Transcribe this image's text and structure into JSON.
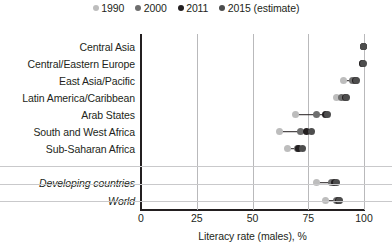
{
  "legend": {
    "items": [
      {
        "label": "1990",
        "color": "#bdbdbd",
        "name": "legend-1990"
      },
      {
        "label": "2000",
        "color": "#6e6e6e",
        "name": "legend-2000"
      },
      {
        "label": "2011",
        "color": "#231f20",
        "name": "legend-2011"
      },
      {
        "label": "2015 (estimate)",
        "color": "#4d4d4d",
        "name": "legend-2015"
      }
    ]
  },
  "chart_data": {
    "type": "scatter",
    "title": "",
    "xlabel": "Literacy rate (males), %",
    "ylabel": "",
    "xlim": [
      0,
      100
    ],
    "xticks": [
      0,
      25,
      50,
      75,
      100
    ],
    "grid": true,
    "legend_position": "top-center",
    "series": [
      {
        "name": "1990",
        "color": "#bdbdbd"
      },
      {
        "name": "2000",
        "color": "#6e6e6e"
      },
      {
        "name": "2011",
        "color": "#231f20"
      },
      {
        "name": "2015 (estimate)",
        "color": "#4d4d4d"
      }
    ],
    "categories": [
      "Central Asia",
      "Central/Eastern Europe",
      "East Asia/Pacific",
      "Latin America/Caribbean",
      "Arab States",
      "South and West Africa",
      "Sub-Saharan Africa",
      "Developing countries",
      "World"
    ],
    "rows": [
      {
        "label": "Central Asia",
        "italic": false,
        "group": "region",
        "values": {
          "1990": 99.6,
          "2000": 99.7,
          "2011": 99.8,
          "2015": 99.8
        }
      },
      {
        "label": "Central/Eastern Europe",
        "italic": false,
        "group": "region",
        "values": {
          "1990": 99.2,
          "2000": 99.4,
          "2011": 99.5,
          "2015": 99.6
        }
      },
      {
        "label": "East Asia/Pacific",
        "italic": false,
        "group": "region",
        "values": {
          "1990": 90.8,
          "2000": 94.8,
          "2011": 96.3,
          "2015": 96.8
        }
      },
      {
        "label": "Latin America/Caribbean",
        "italic": false,
        "group": "region",
        "values": {
          "1990": 87.5,
          "2000": 90.0,
          "2011": 91.6,
          "2015": 92.2
        }
      },
      {
        "label": "Arab States",
        "italic": false,
        "group": "region",
        "values": {
          "1990": 69.3,
          "2000": 78.5,
          "2011": 82.9,
          "2015": 83.8
        }
      },
      {
        "label": "South and West Africa",
        "italic": false,
        "group": "region",
        "values": {
          "1990": 62.0,
          "2000": 71.6,
          "2011": 74.0,
          "2015": 76.6
        }
      },
      {
        "label": "Sub-Saharan Africa",
        "italic": false,
        "group": "region",
        "values": {
          "1990": 65.5,
          "2000": 70.0,
          "2011": 70.6,
          "2015": 72.4
        }
      },
      {
        "label": "Developing countries",
        "italic": true,
        "group": "aggregate",
        "values": {
          "1990": 78.7,
          "2000": 85.3,
          "2011": 86.6,
          "2015": 87.6
        }
      },
      {
        "label": "World",
        "italic": true,
        "group": "aggregate",
        "values": {
          "1990": 82.9,
          "2000": 87.8,
          "2011": 88.5,
          "2015": 89.2
        }
      }
    ]
  }
}
